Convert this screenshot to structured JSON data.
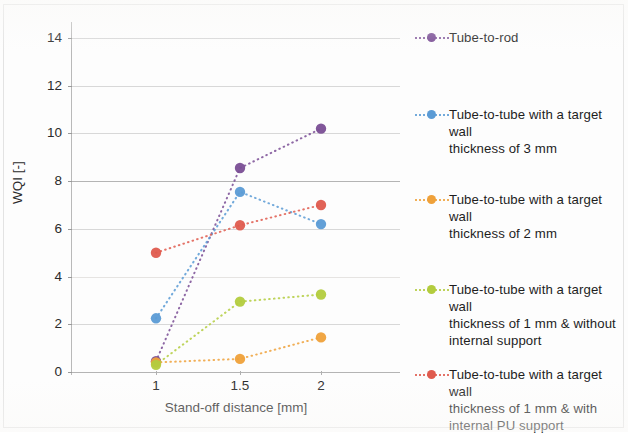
{
  "chart_data": {
    "type": "line",
    "title": "",
    "xlabel": "Stand-off distance [mm]",
    "ylabel": "WQI [-]",
    "x": [
      1,
      1.5,
      2
    ],
    "categories": [
      "1",
      "1.5",
      "2"
    ],
    "xtick_labels": [
      "1",
      "1.5",
      "2"
    ],
    "ytick_labels": [
      "0",
      "2",
      "4",
      "6",
      "8",
      "10",
      "12",
      "14"
    ],
    "yticks": [
      0,
      2,
      4,
      6,
      8,
      10,
      12,
      14
    ],
    "ylim": [
      0,
      15
    ],
    "xlim": [
      0.75,
      2.25
    ],
    "grid": "horizontal",
    "legend_position": "right",
    "marker": "circle",
    "linestyle": "dotted",
    "series": [
      {
        "name": "Tube-to-rod",
        "label": "Tube-to-rod",
        "color": "#7a4e95",
        "values": [
          0.45,
          8.55,
          10.2
        ]
      },
      {
        "name": "Tube-to-tube 3 mm",
        "label": "Tube-to-tube with a target wall\nthickness of 3 mm",
        "color": "#5b9bd5",
        "values": [
          2.25,
          7.55,
          6.2
        ]
      },
      {
        "name": "Tube-to-tube 2 mm",
        "label": "Tube-to-tube with a target wall\nthickness of 2 mm",
        "color": "#efa13a",
        "values": [
          0.4,
          0.55,
          1.45
        ]
      },
      {
        "name": "Tube-to-tube 1 mm without internal support",
        "label": "Tube-to-tube with a target wall\nthickness of 1 mm & without\ninternal support",
        "color": "#b3cc3e",
        "values": [
          0.3,
          2.95,
          3.25
        ]
      },
      {
        "name": "Tube-to-tube 1 mm with internal PU support",
        "label": "Tube-to-tube with a target wall\nthickness of 1 mm & with\ninternal PU support",
        "color": "#df5b4e",
        "values": [
          5.0,
          6.15,
          7.0
        ]
      }
    ]
  },
  "colors": {
    "purple": "#7a4e95",
    "blue": "#5b9bd5",
    "orange": "#efa13a",
    "green": "#b3cc3e",
    "red": "#df5b4e",
    "gridline": "#d8d8d8",
    "axis": "#b9b9b9",
    "text": "#2b2b2b"
  }
}
